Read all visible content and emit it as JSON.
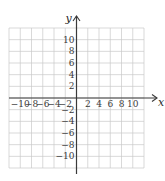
{
  "chart_data": {
    "type": "scatter",
    "title": "",
    "xlabel": "x",
    "ylabel": "y",
    "xlim": [
      -12,
      12
    ],
    "ylim": [
      -12,
      12
    ],
    "grid": true,
    "grid_step": 2,
    "x_ticks": [
      -10,
      -8,
      -6,
      -4,
      -2,
      2,
      4,
      6,
      8,
      10
    ],
    "y_ticks": [
      10,
      8,
      6,
      4,
      2,
      -2,
      -4,
      -6,
      -8,
      -10
    ],
    "x_tick_labels": [
      "−10",
      "−8",
      "−6",
      "−4",
      "−2",
      "2",
      "4",
      "6",
      "8",
      "10"
    ],
    "y_tick_labels": [
      "10",
      "8",
      "6",
      "4",
      "2",
      "−2",
      "−4",
      "−6",
      "−8",
      "−10"
    ],
    "series": [],
    "colors": {
      "grid": "#c9c9c9",
      "axis": "#3a3a3a"
    }
  }
}
